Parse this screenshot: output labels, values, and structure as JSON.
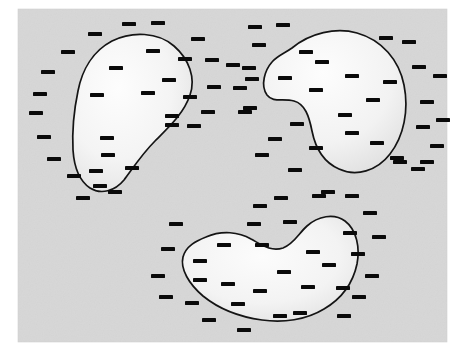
{
  "figure": {
    "title": "Three enclosed regions with scattered minus-sign marks",
    "type": "diagram",
    "canvas": {
      "width": 458,
      "height": 359,
      "background": "#ffffff"
    },
    "panel": {
      "name": "gray-background-panel",
      "x": 18,
      "y": 9,
      "width": 429,
      "height": 333,
      "fill": "#d7d7d7",
      "noise": true
    },
    "style": {
      "outline_color": "#141414",
      "outline_width": 1.7,
      "shape_fill_light": "#fbfbfb",
      "shape_fill_dark": "#dcdcdc",
      "dash_color": "#0a0a0a",
      "dash_width": 14,
      "dash_height": 4,
      "accent": "#141414"
    },
    "regions": [
      {
        "id": "region-top-left",
        "label": "Top-left bean region",
        "centroid": [
          126,
          117
        ],
        "path": "M 112 41 C 132 31, 158 32, 174 46 C 189 59, 196 78, 190 95 C 184 113, 170 126, 155 141 C 142 154, 133 168, 124 180 C 115 191, 101 195, 90 188 C 78 180, 74 165, 73 150 C 72 130, 74 110, 78 91 C 82 70, 93 51, 112 41 Z"
      },
      {
        "id": "region-top-right",
        "label": "Top-right bean region",
        "centroid": [
          330,
          105
        ],
        "path": "M 292 48 C 310 33, 336 27, 357 33 C 382 40, 399 60, 404 85 C 409 110, 404 136, 390 154 C 377 171, 356 177, 339 169 C 323 162, 315 146, 312 131 C 309 116, 305 104, 294 101 C 283 98, 273 103, 267 95 C 260 85, 265 70, 272 62 C 277 56, 285 53, 292 48 Z"
      },
      {
        "id": "region-bottom",
        "label": "Bottom bean region",
        "centroid": [
          244,
          272
        ],
        "path": "M 206 237 C 222 230, 239 232, 251 239 C 262 245, 271 252, 283 248 C 294 244, 299 233, 307 226 C 318 216, 334 213, 345 221 C 357 230, 360 248, 357 264 C 353 283, 341 299, 324 309 C 306 320, 283 323, 262 320 C 240 317, 219 309, 203 296 C 189 284, 180 269, 183 257 C 186 246, 196 241, 206 237 Z"
      }
    ],
    "dashes_outside": [
      [
        129,
        24
      ],
      [
        158,
        23
      ],
      [
        95,
        34
      ],
      [
        68,
        52
      ],
      [
        48,
        72
      ],
      [
        40,
        94
      ],
      [
        36,
        113
      ],
      [
        44,
        137
      ],
      [
        54,
        159
      ],
      [
        74,
        176
      ],
      [
        100,
        186
      ],
      [
        83,
        198
      ],
      [
        115,
        192
      ],
      [
        198,
        39
      ],
      [
        185,
        59
      ],
      [
        212,
        60
      ],
      [
        214,
        87
      ],
      [
        190,
        97
      ],
      [
        172,
        125
      ],
      [
        194,
        126
      ],
      [
        208,
        112
      ],
      [
        233,
        65
      ],
      [
        240,
        88
      ],
      [
        245,
        112
      ],
      [
        255,
        27
      ],
      [
        283,
        25
      ],
      [
        259,
        45
      ],
      [
        249,
        68
      ],
      [
        252,
        79
      ],
      [
        250,
        108
      ],
      [
        275,
        139
      ],
      [
        297,
        124
      ],
      [
        262,
        155
      ],
      [
        295,
        170
      ],
      [
        328,
        192
      ],
      [
        386,
        38
      ],
      [
        409,
        42
      ],
      [
        419,
        67
      ],
      [
        440,
        76
      ],
      [
        427,
        102
      ],
      [
        423,
        127
      ],
      [
        443,
        120
      ],
      [
        437,
        146
      ],
      [
        427,
        162
      ],
      [
        418,
        169
      ],
      [
        400,
        162
      ],
      [
        352,
        196
      ],
      [
        397,
        158
      ],
      [
        260,
        206
      ],
      [
        281,
        198
      ],
      [
        319,
        196
      ],
      [
        254,
        224
      ],
      [
        290,
        222
      ],
      [
        176,
        224
      ],
      [
        168,
        249
      ],
      [
        158,
        276
      ],
      [
        166,
        297
      ],
      [
        192,
        303
      ],
      [
        209,
        320
      ],
      [
        244,
        330
      ],
      [
        280,
        316
      ],
      [
        300,
        313
      ],
      [
        344,
        316
      ],
      [
        359,
        297
      ],
      [
        343,
        288
      ],
      [
        372,
        276
      ],
      [
        358,
        254
      ],
      [
        350,
        233
      ],
      [
        379,
        237
      ],
      [
        370,
        213
      ]
    ],
    "dashes_inside": [
      [
        153,
        51
      ],
      [
        116,
        68
      ],
      [
        169,
        80
      ],
      [
        97,
        95
      ],
      [
        148,
        93
      ],
      [
        172,
        116
      ],
      [
        107,
        138
      ],
      [
        108,
        155
      ],
      [
        96,
        171
      ],
      [
        132,
        168
      ],
      [
        306,
        52
      ],
      [
        285,
        78
      ],
      [
        322,
        62
      ],
      [
        316,
        90
      ],
      [
        352,
        76
      ],
      [
        390,
        82
      ],
      [
        345,
        115
      ],
      [
        373,
        100
      ],
      [
        352,
        133
      ],
      [
        316,
        148
      ],
      [
        377,
        143
      ],
      [
        224,
        245
      ],
      [
        262,
        245
      ],
      [
        200,
        261
      ],
      [
        313,
        252
      ],
      [
        284,
        272
      ],
      [
        200,
        280
      ],
      [
        228,
        284
      ],
      [
        308,
        287
      ],
      [
        260,
        291
      ],
      [
        238,
        304
      ],
      [
        329,
        265
      ]
    ]
  }
}
